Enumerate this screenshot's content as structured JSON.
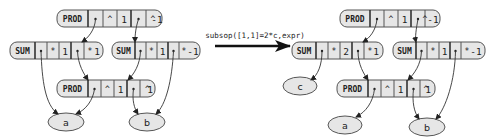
{
  "transform": {
    "label": "subsop([1,1]=2*c,expr)",
    "arrow_color": "#111111"
  },
  "before": {
    "prod_top": {
      "head": "PROD",
      "cells": [
        "^",
        "1",
        "^",
        "-1"
      ]
    },
    "sum_left": {
      "head": "SUM",
      "cells": [
        "*",
        "1",
        "*",
        "1"
      ]
    },
    "sum_right": {
      "head": "SUM",
      "cells": [
        "*",
        "1",
        "*",
        "-1"
      ]
    },
    "prod_bottom": {
      "head": "PROD",
      "cells": [
        "^",
        "1",
        "^",
        "1"
      ]
    },
    "leaves": [
      "a",
      "b"
    ]
  },
  "after": {
    "prod_top": {
      "head": "PROD",
      "cells": [
        "^",
        "1",
        "^",
        "-1"
      ]
    },
    "sum_left": {
      "head": "SUM",
      "cells": [
        "*",
        "2",
        "*",
        "1"
      ]
    },
    "sum_right": {
      "head": "SUM",
      "cells": [
        "*",
        "1",
        "*",
        "-1"
      ]
    },
    "prod_bottom": {
      "head": "PROD",
      "cells": [
        "^",
        "1",
        "^",
        "1"
      ]
    },
    "leaves": [
      "c",
      "a",
      "b"
    ]
  },
  "colors": {
    "node_fill": "#e6e6e6",
    "node_stroke": "#555555",
    "text": "#222222"
  }
}
